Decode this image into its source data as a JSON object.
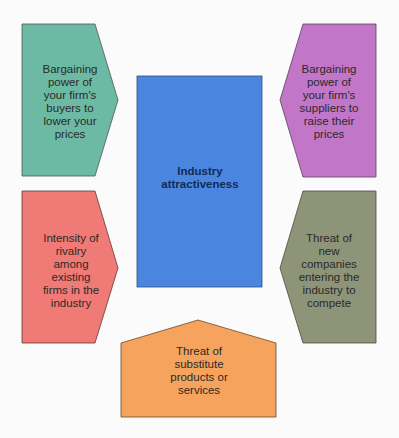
{
  "diagram": {
    "title": "Industry attractiveness",
    "center": {
      "label_line1": "Industry",
      "label_line2": "attractiveness",
      "color": "#4a86e0"
    },
    "forces": [
      {
        "id": "buyers",
        "position": "top-left",
        "shape": "arrow-right",
        "color": "#6cbaa4",
        "text": "Bargaining power of your firm's buyers to lower your prices"
      },
      {
        "id": "suppliers",
        "position": "top-right",
        "shape": "arrow-left",
        "color": "#c176c8",
        "text": "Bargaining power of your firm's suppliers to raise their prices"
      },
      {
        "id": "rivalry",
        "position": "bottom-left",
        "shape": "arrow-right",
        "color": "#f07a76",
        "text": "Intensity of rivalry among existing firms in the industry"
      },
      {
        "id": "new-entrants",
        "position": "bottom-right",
        "shape": "arrow-left",
        "color": "#8e9478",
        "text": "Threat of new companies entering the industry to compete"
      },
      {
        "id": "substitutes",
        "position": "bottom",
        "shape": "arrow-up",
        "color": "#f6a35e",
        "text": "Threat of substitute products or services"
      }
    ]
  }
}
